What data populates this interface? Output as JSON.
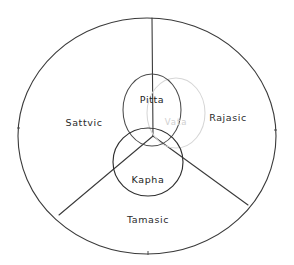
{
  "diagram": {
    "background_color": "#ffffff",
    "ink_color": "#3a3a3a",
    "faint_color": "#d6d6d6",
    "outer": {
      "name": "outer-circle",
      "center_x": 147,
      "center_y": 136,
      "radius_x": 129,
      "radius_y": 118
    },
    "gunas": [
      {
        "id": "sattvic",
        "label": "Sattvic",
        "position": "left sector",
        "x": 84,
        "y": 123
      },
      {
        "id": "rajasic",
        "label": "Rajasic",
        "position": "right sector",
        "x": 228,
        "y": 118
      },
      {
        "id": "tamasic",
        "label": "Tamasic",
        "position": "bottom sector",
        "x": 148,
        "y": 220
      }
    ],
    "doshas": [
      {
        "id": "pitta",
        "label": "Pitta",
        "shape": "ellipse",
        "color": "#4a4a4a",
        "center_x": 152,
        "center_y": 110,
        "radius_x": 29,
        "radius_y": 36,
        "label_x": 152,
        "label_y": 100
      },
      {
        "id": "vata",
        "label": "Vata",
        "shape": "ellipse",
        "color": "#d6d6d6",
        "center_x": 176,
        "center_y": 113,
        "radius_x": 29,
        "radius_y": 35,
        "label_x": 176,
        "label_y": 122
      },
      {
        "id": "kapha",
        "label": "Kapha",
        "shape": "ellipse",
        "color": "#2f2f2f",
        "center_x": 148,
        "center_y": 162,
        "radius_x": 35,
        "radius_y": 34,
        "label_x": 148,
        "label_y": 180
      }
    ],
    "dividers": [
      {
        "id": "divider-top",
        "from_x": 153,
        "from_y": 136,
        "to_x": 152,
        "to_y": 18
      },
      {
        "id": "divider-lower-left",
        "from_x": 153,
        "from_y": 136,
        "to_x": 59,
        "to_y": 215
      },
      {
        "id": "divider-lower-right",
        "from_x": 153,
        "from_y": 136,
        "to_x": 248,
        "to_y": 205
      }
    ]
  }
}
